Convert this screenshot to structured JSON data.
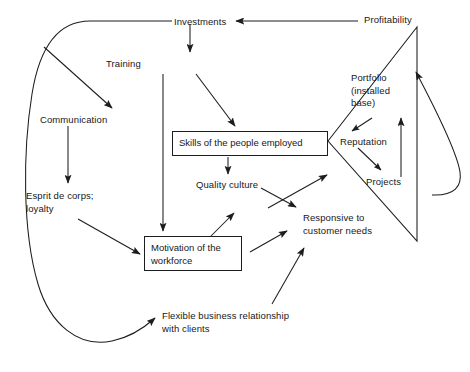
{
  "diagram": {
    "background_color": "#ffffff",
    "line_color": "#1b1d1f",
    "text_color": "#16181a",
    "width": 470,
    "height": 372,
    "nodes": [
      {
        "id": "investments",
        "label": "Investments",
        "x": 174,
        "y": 16,
        "type": "plain"
      },
      {
        "id": "profitability",
        "label": "Profitability",
        "x": 364,
        "y": 14,
        "type": "plain"
      },
      {
        "id": "training",
        "label": "Training",
        "x": 106,
        "y": 58,
        "type": "plain"
      },
      {
        "id": "communication",
        "label": "Communication",
        "x": 40,
        "y": 114,
        "type": "plain"
      },
      {
        "id": "portfolio",
        "label": "Portfolio\n(installed\nbase)",
        "x": 351,
        "y": 72,
        "type": "plain"
      },
      {
        "id": "skills",
        "label": "Skills of the people employed",
        "x": 172,
        "y": 131,
        "type": "box",
        "w": 156,
        "h": 25
      },
      {
        "id": "reputation",
        "label": "Reputation",
        "x": 340,
        "y": 136,
        "type": "plain"
      },
      {
        "id": "projects",
        "label": "Projects",
        "x": 366,
        "y": 176,
        "type": "plain"
      },
      {
        "id": "quality",
        "label": "Quality culture",
        "x": 196,
        "y": 179,
        "type": "plain"
      },
      {
        "id": "esprit",
        "label": "Esprit de corps;\nloyalty",
        "x": 26,
        "y": 190,
        "type": "plain"
      },
      {
        "id": "responsive",
        "label": "Responsive to\ncustomer needs",
        "x": 303,
        "y": 212,
        "type": "plain"
      },
      {
        "id": "motivation",
        "label": "Motivation of the\nworkforce",
        "x": 144,
        "y": 236,
        "type": "box",
        "w": 98,
        "h": 35
      },
      {
        "id": "flexible",
        "label": "Flexible business relationship\nwith clients",
        "x": 162,
        "y": 310,
        "type": "plain"
      }
    ],
    "edges": [
      {
        "id": "profitability-to-investments",
        "from": "profitability",
        "to": "investments",
        "style": "straight",
        "arrow": true
      },
      {
        "id": "investments-to-left-loop",
        "from": "investments",
        "to": "left-loop",
        "style": "curve",
        "arrow": false
      },
      {
        "id": "left-loop-to-flexible",
        "from": "left-loop",
        "to": "flexible",
        "style": "curve",
        "arrow": true
      },
      {
        "id": "left-loop-to-communication",
        "from": "left-loop",
        "to": "communication",
        "style": "straight",
        "arrow": true
      },
      {
        "id": "investments-to-training",
        "from": "investments",
        "to": "training",
        "style": "straight",
        "arrow": true
      },
      {
        "id": "training-to-skills",
        "from": "training",
        "to": "skills",
        "style": "straight",
        "arrow": true
      },
      {
        "id": "training-to-motivation",
        "from": "training",
        "to": "motivation",
        "style": "straight",
        "arrow": true
      },
      {
        "id": "communication-to-esprit",
        "from": "communication",
        "to": "esprit",
        "style": "straight",
        "arrow": true
      },
      {
        "id": "esprit-to-motivation",
        "from": "esprit",
        "to": "motivation",
        "style": "straight",
        "arrow": true
      },
      {
        "id": "skills-to-quality",
        "from": "skills",
        "to": "quality",
        "style": "straight",
        "arrow": true
      },
      {
        "id": "motivation-to-quality",
        "from": "motivation",
        "to": "quality",
        "style": "straight",
        "arrow": true
      },
      {
        "id": "quality-to-responsive",
        "from": "quality",
        "to": "responsive",
        "style": "straight",
        "arrow": true
      },
      {
        "id": "motivation-to-responsive",
        "from": "motivation",
        "to": "responsive",
        "style": "straight",
        "arrow": true
      },
      {
        "id": "flexible-to-responsive",
        "from": "flexible",
        "to": "responsive",
        "style": "straight",
        "arrow": true
      },
      {
        "id": "responsive-to-triangle",
        "from": "responsive",
        "to": "triangle-lower-edge",
        "style": "straight",
        "arrow": true
      },
      {
        "id": "portfolio-to-reputation",
        "from": "portfolio",
        "to": "reputation",
        "style": "straight",
        "arrow": true
      },
      {
        "id": "reputation-to-projects",
        "from": "reputation",
        "to": "projects",
        "style": "straight",
        "arrow": true
      },
      {
        "id": "projects-to-portfolio",
        "from": "projects",
        "to": "portfolio",
        "style": "straight",
        "arrow": true
      },
      {
        "id": "right-loop-to-profitability",
        "from": "right-loop",
        "to": "profitability",
        "style": "curve",
        "arrow": true
      }
    ],
    "shapes": [
      {
        "id": "triangle",
        "type": "triangle",
        "description": "open triangle from skills box apex to profitability vertex and lower-right vertex"
      }
    ]
  }
}
